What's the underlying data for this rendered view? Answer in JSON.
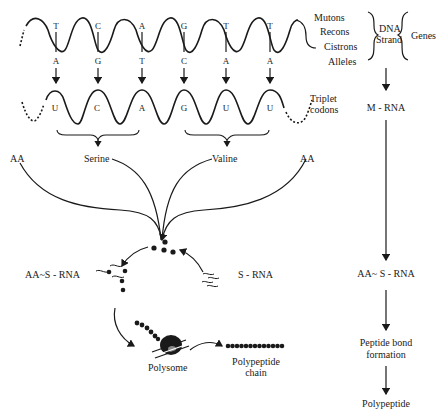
{
  "dna_strand": {
    "top_bases": [
      "T",
      "C",
      "A",
      "G",
      "T",
      "T"
    ],
    "bottom_bases": [
      "A",
      "G",
      "T",
      "C",
      "A",
      "A"
    ]
  },
  "mrna_strand": {
    "bases": [
      "U",
      "C",
      "A",
      "G",
      "U",
      "U"
    ],
    "label_line1": "Triplet",
    "label_line2": "codons"
  },
  "gene_units": {
    "items": [
      "Mutons",
      "Recons",
      "Cistrons",
      "Alleles"
    ],
    "dna_label_line1": "DNA",
    "dna_label_line2": "Strand",
    "genes_label": "Genes"
  },
  "amino_acids": {
    "left_aa": "AA",
    "serine": "Serine",
    "valine": "Valine",
    "right_aa": "AA"
  },
  "cycle": {
    "aa_srna": "AA~S - RNA",
    "srna": "S - RNA",
    "polysome": "Polysome",
    "polypeptide_chain_line1": "Polypeptide",
    "polypeptide_chain_line2": "chain"
  },
  "flow": {
    "steps": [
      "M - RNA",
      "AA~ S - RNA",
      "Peptide bond",
      "formation",
      "Polypeptide"
    ]
  }
}
